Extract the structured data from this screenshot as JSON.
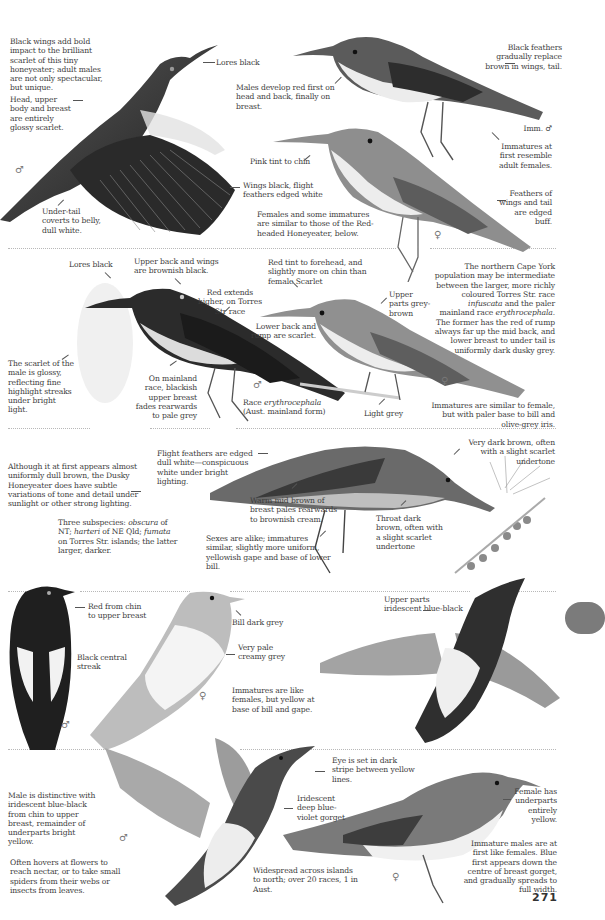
{
  "page": {
    "number": "271",
    "thumb_tab_color": "#7b7b7b"
  },
  "section_scarlet": {
    "intro": "Black wings add bold impact to the brilliant scarlet of this tiny honeyeater; adult males are not only spectacular, but unique.",
    "lores": "Lores black",
    "head": "Head, upper body and breast are entirely glossy scarlet.",
    "male_symbol": "♂",
    "undertail": "Under-tail coverts to belly, dull white.",
    "wings": "Wings black, flight feathers edged white",
    "males_develop": "Males develop red first on head and back, finally on breast.",
    "black_feathers": "Black feathers gradually replace brown in wings, tail.",
    "imm_label": "Imm. ♂",
    "imm_resemble": "Immatures at first resemble adult females.",
    "pink_tint": "Pink tint to chin",
    "females_some": "Females and some immatures are similar to those of the Red-headed Honeyeater, below.",
    "feathers_edged": "Feathers of wings and tail are edged buff.",
    "female_symbol": "♀"
  },
  "section_redheaded": {
    "lores": "Lores black",
    "upper_back": "Upper back and wings are brownish black.",
    "red_extends": "Red extends higher, on Torres Str race",
    "scarlet_glossy": "The scarlet of the male is glossy, reflecting fine highlight streaks under bright light.",
    "mainland": "On mainland race, blackish upper breast fades rearwards to pale grey",
    "male_symbol": "♂",
    "race_prefix": "Race ",
    "race_name": "erythrocephala",
    "race_suffix": "(Aust. mainland form)",
    "lower_back": "Lower back and rump are scarlet.",
    "red_tint": "Red tint to forehead, and slightly more on chin than female Scarlet",
    "upper_parts": "Upper parts grey-brown",
    "light_grey": "Light grey",
    "female_symbol": "♀",
    "cape_york_1": "The northern Cape York population may be intermediate between the larger, more richly coloured Torres Str. race ",
    "cape_york_race1": "infuscata",
    "cape_york_2": " and the paler mainland race ",
    "cape_york_race2": "erythrocephala.",
    "cape_york_3": " The former has the red of rump always far up the mid back, and lower breast to under tail is uniformly dark dusky grey.",
    "immatures": "Immatures are similar to female, but with paler base to bill and olive-grey iris."
  },
  "section_dusky": {
    "although": "Although it at first appears almost uniformly dull brown, the Dusky Honeyeater does have subtle variations of tone and detail under sunlight or other strong lighting.",
    "subspecies_1": "Three subspecies: ",
    "ss1": "obscura",
    "subspecies_2": " of NT; ",
    "ss2": "harteri",
    "subspecies_3": " of NE Qld; ",
    "ss3": "fumata",
    "subspecies_4": " on Torres Str. islands; the latter larger, darker.",
    "flight": "Flight feathers are edged dull white—conspicuous white under bright lighting.",
    "warm": "Warm mid brown of breast pales rearwards to brownish cream.",
    "sexes": "Sexes are alike; immatures similar, slightly more uniform, yellowish gape and base of lower bill.",
    "very_dark": "Very dark brown, often with a slight scarlet undertone",
    "throat": "Throat dark brown, often with a slight scarlet undertone"
  },
  "section_banded": {
    "red_chin": "Red from chin to upper breast",
    "black_streak": "Black central streak",
    "male_symbol": "♂",
    "bill": "Bill dark grey",
    "very_pale": "Very pale creamy grey",
    "female_symbol": "♀",
    "immatures": "Immatures are like females, but yellow at base of bill and gape.",
    "upper_parts": "Upper parts iridescent blue-black"
  },
  "section_sunbird": {
    "male": "Male is distinctive with iridescent blue-black from chin to upper breast, remainder of underparts bright yellow.",
    "hovers": "Often hovers at flowers to reach nectar, or to take small spiders from their webs or insects from leaves.",
    "male_symbol": "♂",
    "eye": "Eye is set in dark stripe between yellow lines.",
    "iridescent": "Iridescent deep blue-violet gorget",
    "widespread": "Widespread across islands to north; over 20 races, 1 in Aust.",
    "female_has": "Female has underparts entirely yellow.",
    "imm_males": "Immature males are at first like females. Blue first appears down the centre of breast gorget, and gradually spreads to full width.",
    "female_symbol": "♀"
  }
}
